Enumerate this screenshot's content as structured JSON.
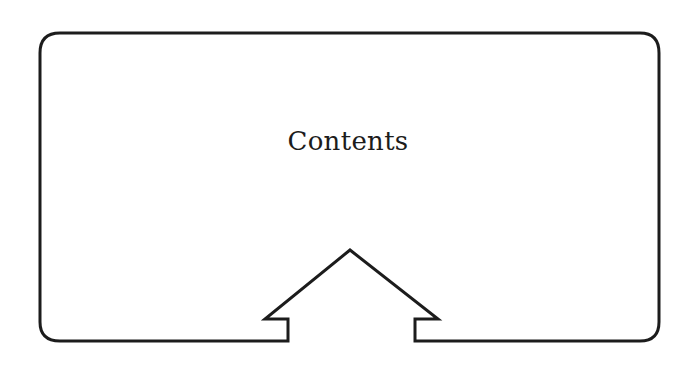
{
  "diagram": {
    "title": "Contents",
    "shape": "rounded-rectangle-with-up-arrow-notch",
    "stroke_color": "#1c1c1c",
    "background_color": "#ffffff",
    "arrow": {
      "direction": "up",
      "icon": "home-arrow-up"
    }
  }
}
